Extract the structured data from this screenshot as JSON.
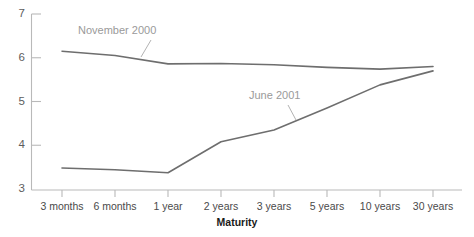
{
  "chart_data": {
    "type": "line",
    "title": "",
    "xlabel": "Maturity",
    "ylabel": "",
    "categories": [
      "3 months",
      "6 months",
      "1 year",
      "2 years",
      "3 years",
      "5 years",
      "10 years",
      "30 years"
    ],
    "yticks": [
      3,
      4,
      5,
      6,
      7
    ],
    "ylim": [
      3,
      7
    ],
    "grid": false,
    "legend_position": "inline-annotation",
    "series": [
      {
        "name": "November 2000",
        "values": [
          6.15,
          6.05,
          5.86,
          5.87,
          5.84,
          5.78,
          5.74,
          5.8
        ],
        "color": "#6e6e6e",
        "annotation": "November 2000"
      },
      {
        "name": "June 2001",
        "values": [
          3.48,
          3.44,
          3.37,
          4.08,
          4.35,
          4.85,
          5.38,
          5.7
        ],
        "color": "#6e6e6e",
        "annotation": "June 2001"
      }
    ],
    "annotations": [
      {
        "label": "November 2000",
        "x_px": 78,
        "y_px": 34
      },
      {
        "label": "June 2001",
        "x_px": 249,
        "y_px": 99
      }
    ]
  },
  "axis": {
    "y_labels": [
      "7",
      "6",
      "5",
      "4",
      "3"
    ],
    "x_labels": [
      "3 months",
      "6 months",
      "1 year",
      "2 years",
      "3 years",
      "5 years",
      "10 years",
      "30 years"
    ],
    "x_axis_title": "Maturity"
  },
  "colors": {
    "series_stroke": "#6e6e6e",
    "axis": "#b9b9b9",
    "annotation_text": "#9a9a9a",
    "tick_text": "#4a4a4a",
    "background": "#ffffff"
  }
}
